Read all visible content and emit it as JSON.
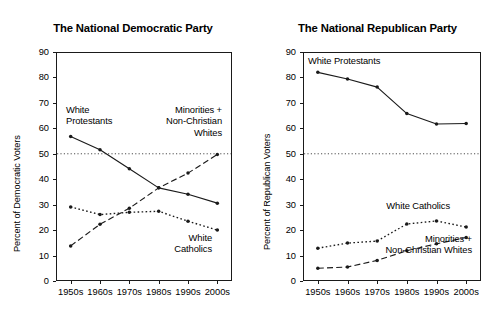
{
  "figure": {
    "background": "#ffffff",
    "ink": "#1a1a1a"
  },
  "chart_data": [
    {
      "type": "line",
      "id": "democratic",
      "title": "The National Democratic Party",
      "xlabel": "",
      "ylabel": "Percent of Democratic Voters",
      "categories": [
        "1950s",
        "1960s",
        "1970s",
        "1980s",
        "1990s",
        "2000s"
      ],
      "ylim": [
        0,
        90
      ],
      "yticks": [
        0,
        10,
        20,
        30,
        40,
        50,
        60,
        70,
        80,
        90
      ],
      "grid": false,
      "reference_line": {
        "value": 50,
        "style": "dotted"
      },
      "legend": "inline-annotations",
      "series": [
        {
          "name": "White Protestants",
          "style": "solid",
          "values": [
            56.8,
            51.6,
            44.1,
            36.6,
            34.1,
            30.6
          ],
          "label_lines": [
            "White",
            "Protestants"
          ],
          "label_align": "left"
        },
        {
          "name": "Minorities + Non-Christian Whites",
          "style": "dashed",
          "values": [
            13.8,
            22.3,
            28.6,
            36.6,
            42.4,
            49.7
          ],
          "label_lines": [
            "Minorities +",
            "Non-Christian",
            "Whites"
          ],
          "label_align": "right"
        },
        {
          "name": "White Catholics",
          "style": "dotted",
          "values": [
            29.1,
            26.1,
            27.0,
            27.4,
            23.5,
            20.0
          ],
          "label_lines": [
            "White",
            "Catholics"
          ],
          "label_align": "center"
        }
      ]
    },
    {
      "type": "line",
      "id": "republican",
      "title": "The National Republican Party",
      "xlabel": "",
      "ylabel": "Percent of Republican Voters",
      "categories": [
        "1950s",
        "1960s",
        "1970s",
        "1980s",
        "1990s",
        "2000s"
      ],
      "ylim": [
        0,
        90
      ],
      "yticks": [
        0,
        10,
        20,
        30,
        40,
        50,
        60,
        70,
        80,
        90
      ],
      "grid": false,
      "reference_line": {
        "value": 50,
        "style": "dotted"
      },
      "legend": "inline-annotations",
      "series": [
        {
          "name": "White Protestants",
          "style": "solid",
          "values": [
            82.0,
            79.4,
            76.2,
            65.8,
            61.7,
            61.9
          ],
          "label_lines": [
            "White Protestants"
          ],
          "label_align": "left"
        },
        {
          "name": "White Catholics",
          "style": "dotted",
          "values": [
            12.9,
            14.9,
            15.7,
            22.4,
            23.6,
            21.2
          ],
          "label_lines": [
            "White Catholics"
          ],
          "label_align": "center"
        },
        {
          "name": "Minorities + Non-Christian Whites",
          "style": "dashed",
          "values": [
            5.0,
            5.5,
            8.1,
            11.9,
            14.6,
            17.1
          ],
          "label_lines": [
            "Minorities +",
            "Non-Christian Whites"
          ],
          "label_align": "center"
        }
      ]
    }
  ]
}
